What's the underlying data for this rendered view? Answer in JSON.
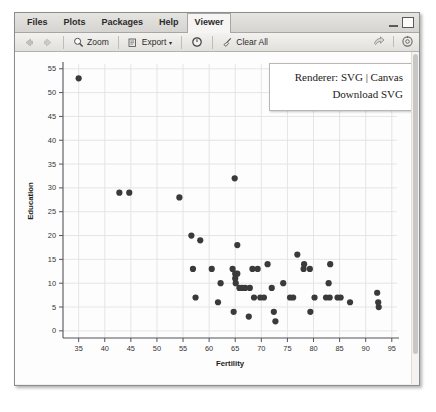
{
  "window": {
    "minimize_label": "minimize",
    "maximize_label": "maximize"
  },
  "tabs": [
    {
      "label": "Files",
      "active": false
    },
    {
      "label": "Plots",
      "active": false
    },
    {
      "label": "Packages",
      "active": false
    },
    {
      "label": "Help",
      "active": false
    },
    {
      "label": "Viewer",
      "active": true
    }
  ],
  "toolbar": {
    "back_label": "",
    "forward_label": "",
    "zoom_label": "Zoom",
    "export_label": "Export",
    "export_caret": "▾",
    "refresh_label": "",
    "clear_all_label": "Clear All",
    "publish_label": "",
    "settings_label": ""
  },
  "renderer_panel": {
    "prefix": "Renderer:",
    "option_svg": "SVG",
    "separator": "|",
    "option_canvas": "Canvas",
    "download_label": "Download SVG"
  },
  "chart_data": {
    "type": "scatter",
    "title": "",
    "xlabel": "Fertility",
    "ylabel": "Education",
    "xlim": [
      32,
      96
    ],
    "ylim": [
      -1.5,
      56
    ],
    "xticks": [
      35,
      40,
      45,
      50,
      55,
      60,
      65,
      70,
      75,
      80,
      85,
      90,
      95
    ],
    "yticks": [
      0,
      5,
      10,
      15,
      20,
      25,
      30,
      35,
      40,
      45,
      50,
      55
    ],
    "grid": true,
    "legend": "none",
    "point_color": "#3a3a3a",
    "point_size": 3.1,
    "points": [
      [
        35.0,
        53
      ],
      [
        42.8,
        29
      ],
      [
        44.7,
        29
      ],
      [
        54.3,
        28
      ],
      [
        56.6,
        20
      ],
      [
        58.3,
        19
      ],
      [
        64.9,
        32
      ],
      [
        65.4,
        18
      ],
      [
        56.9,
        13
      ],
      [
        57.4,
        7
      ],
      [
        61.7,
        6
      ],
      [
        60.5,
        13
      ],
      [
        62.2,
        10
      ],
      [
        64.5,
        13
      ],
      [
        65.0,
        12
      ],
      [
        65.4,
        12
      ],
      [
        65.0,
        11
      ],
      [
        65.1,
        10
      ],
      [
        65.8,
        9
      ],
      [
        66.3,
        9
      ],
      [
        66.9,
        9
      ],
      [
        67.8,
        9
      ],
      [
        64.7,
        4
      ],
      [
        68.3,
        13
      ],
      [
        69.3,
        13
      ],
      [
        68.6,
        7
      ],
      [
        69.8,
        7
      ],
      [
        70.5,
        7
      ],
      [
        67.6,
        3
      ],
      [
        71.2,
        14
      ],
      [
        72.0,
        9
      ],
      [
        72.4,
        4
      ],
      [
        72.7,
        2
      ],
      [
        74.2,
        10
      ],
      [
        75.5,
        7
      ],
      [
        76.1,
        7
      ],
      [
        76.9,
        16
      ],
      [
        78.1,
        13
      ],
      [
        78.2,
        14
      ],
      [
        79.3,
        13
      ],
      [
        79.4,
        4
      ],
      [
        80.2,
        7
      ],
      [
        82.4,
        7
      ],
      [
        83.1,
        7
      ],
      [
        82.9,
        10
      ],
      [
        83.2,
        14
      ],
      [
        84.6,
        7
      ],
      [
        85.2,
        7
      ],
      [
        87.0,
        6
      ],
      [
        92.2,
        8
      ],
      [
        92.4,
        6
      ],
      [
        92.5,
        5
      ]
    ]
  }
}
